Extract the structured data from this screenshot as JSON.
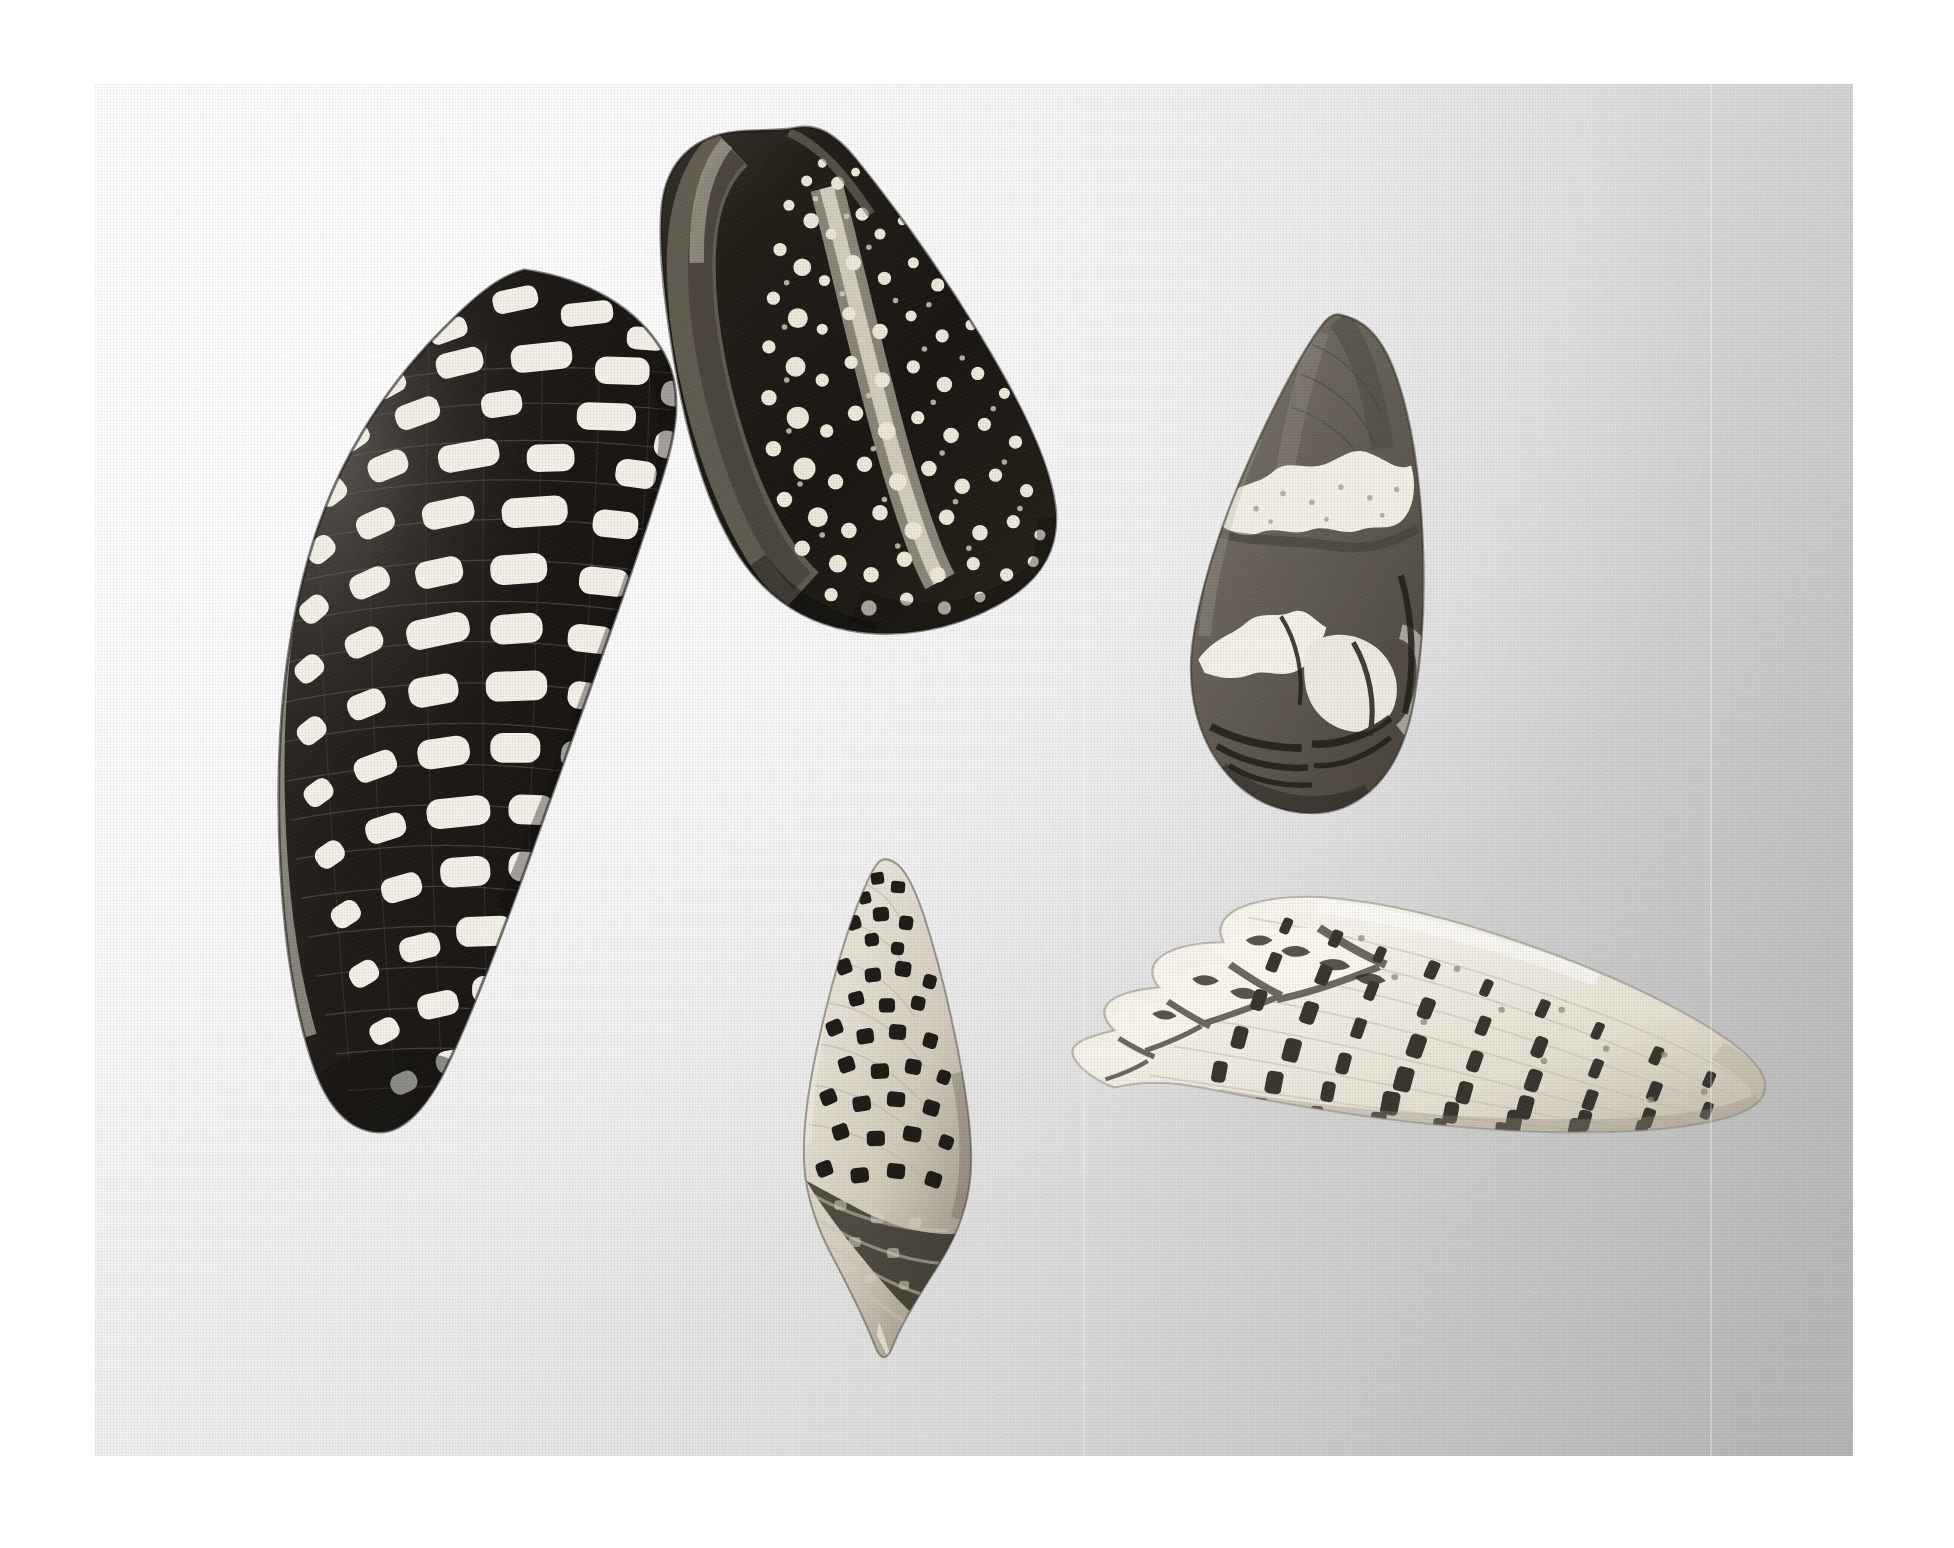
{
  "page": {
    "medium": "black-and-white halftone photographic plate",
    "background_color": "#ffffff",
    "print_area": {
      "left": 95,
      "top": 84,
      "width": 1758,
      "height": 1372
    },
    "background_description": "smooth studio backdrop, brightly lit from the upper left, falling off to medium grey at lower right",
    "background_light_color": "#fbfbfb",
    "background_dark_color": "#b6b6b6",
    "creases": [
      {
        "name": "vertical-crease-left",
        "x": 1083
      },
      {
        "name": "vertical-crease-right",
        "x": 1710
      }
    ]
  },
  "subject": {
    "title": "Five cone shells",
    "count": 5,
    "genus": "Conus",
    "arrangement": "three shells across the upper register, two smaller shells below"
  },
  "shells": [
    {
      "id": "shell-large-left",
      "name": "large tessellated cone shell",
      "position_label": "upper left",
      "bbox": {
        "x": 190,
        "y": 330,
        "width": 510,
        "height": 840
      },
      "orientation": "apex upper right, tapering to the lower left",
      "ground_color": "#2a2722",
      "marking_color": "#f4f1e8",
      "pattern": "dense grid of white rectangular tiles over a near-black ground, crossed by fine spiral threads",
      "relative_size": "largest"
    },
    {
      "id": "shell-top-center",
      "name": "speckled cone shell, aperture view",
      "position_label": "top centre",
      "bbox": {
        "x": 625,
        "y": 160,
        "width": 450,
        "height": 515
      },
      "orientation": "apex upper left, aperture facing the viewer",
      "ground_color": "#26241f",
      "marking_color": "#efeadf",
      "pattern": "very dark ground peppered with small triangular white flecks; pale polished columella running down the centre",
      "relative_size": "large"
    },
    {
      "id": "shell-right",
      "name": "blotched cone shell",
      "position_label": "upper right",
      "bbox": {
        "x": 1180,
        "y": 345,
        "width": 285,
        "height": 465
      },
      "orientation": "apex up, base lower left",
      "ground_color": "#6d6a64",
      "marking_color": "#f6f3ea",
      "pattern": "two broad irregular cloud-white bands across a soft grey-brown ground, dark chevrons around the base",
      "relative_size": "medium"
    },
    {
      "id": "shell-bottom-center",
      "name": "small biconic spotted shell",
      "position_label": "bottom centre",
      "bbox": {
        "x": 790,
        "y": 890,
        "width": 200,
        "height": 440
      },
      "orientation": "upright, sharply pointed siphonal canal at the base",
      "ground_color": "#efebe1",
      "marking_color": "#221f1b",
      "pattern": "rows of dark square blotches over a pale ground, dark shaded shoulder and base",
      "relative_size": "smallest"
    },
    {
      "id": "shell-bottom-right",
      "name": "white cone shell with dark flecks",
      "position_label": "bottom right",
      "bbox": {
        "x": 1040,
        "y": 870,
        "width": 710,
        "height": 300
      },
      "orientation": "lying on its side, tall stepped spire to the left, broad base to the right",
      "ground_color": "#f7f4ec",
      "marking_color": "#3b3833",
      "pattern": "chalk-white body whorl marked with spiral rows of short dark dashes; deeply stepped, coronate spire",
      "relative_size": "large"
    }
  ]
}
